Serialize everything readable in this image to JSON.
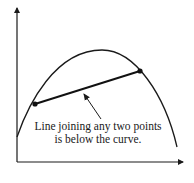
{
  "diagram": {
    "type": "concave-function-illustration",
    "colors": {
      "background": "#ffffff",
      "stroke": "#1a1a1a"
    },
    "axes": {
      "has_x_arrow": true,
      "has_y_arrow": true,
      "x_label": "",
      "y_label": ""
    },
    "curve": {
      "shape": "concave (inverted-U)",
      "description": "Curve rising from left, peaking near center, falling to the right"
    },
    "chord": {
      "endpoints": [
        "left point on curve",
        "right point on curve"
      ],
      "marked_points": 2
    },
    "annotation": {
      "line1": "Line joining any two points",
      "line2": "is below the curve."
    }
  }
}
